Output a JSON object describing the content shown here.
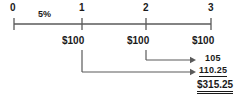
{
  "diagram": {
    "rate_label": "5%",
    "line_color": "#5a5a5a",
    "text_color": "#1a1a1a",
    "background": "#ffffff"
  },
  "timeline": {
    "periods": [
      {
        "label": "0",
        "x": 14
      },
      {
        "label": "1",
        "x": 82
      },
      {
        "label": "2",
        "x": 146
      },
      {
        "label": "3",
        "x": 211
      }
    ],
    "axis_y": 24
  },
  "cash_flows": [
    {
      "label": "$100",
      "period": "1",
      "x": 82
    },
    {
      "label": "$100",
      "period": "2",
      "x": 146
    },
    {
      "label": "$100",
      "period": "3",
      "x": 211
    }
  ],
  "arrows": [
    {
      "name": "compound-from-period-2",
      "from_x": 146,
      "to_x": 196,
      "y": 60,
      "stem_top": 50
    },
    {
      "name": "compound-from-period-1",
      "from_x": 82,
      "to_x": 196,
      "y": 72,
      "stem_top": 50
    }
  ],
  "future_values": [
    {
      "label": "105",
      "underline": false
    },
    {
      "label": "110.25",
      "underline": true
    }
  ],
  "total": {
    "label": "$315.25",
    "double_underline": true
  }
}
